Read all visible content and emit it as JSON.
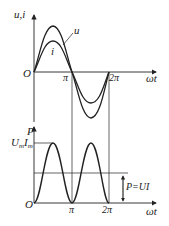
{
  "diagram": {
    "top_plot": {
      "y_axis_label": "u,i",
      "x_axis_label": "ωt",
      "origin_label": "O",
      "tick_labels": [
        "π",
        "2π"
      ],
      "curves": [
        {
          "name": "u",
          "label": "u",
          "amplitude": "larger"
        },
        {
          "name": "i",
          "label": "i",
          "amplitude": "smaller",
          "phase": "in phase with u"
        }
      ]
    },
    "bottom_plot": {
      "y_axis_label": "P",
      "peak_label_main": "U",
      "peak_label_sub1": "m",
      "peak_label_mid": "I",
      "peak_label_sub2": "m",
      "x_axis_label": "ωt",
      "origin_label": "O",
      "tick_labels": [
        "π",
        "2π"
      ],
      "average_label": "P=UI",
      "curve": "p = u·i (sin² shape, two peaks per period)"
    }
  }
}
